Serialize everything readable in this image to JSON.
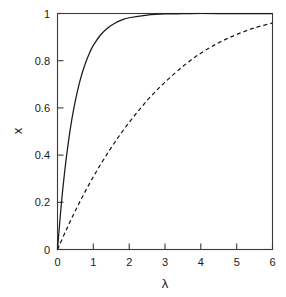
{
  "chart_data": {
    "type": "line",
    "title": "",
    "subtitle": "",
    "xlabel": "λ",
    "ylabel": "x",
    "xlim": [
      0,
      6
    ],
    "ylim": [
      0,
      1
    ],
    "grid": false,
    "legend": "none",
    "xticks": [
      0,
      1,
      2,
      3,
      4,
      5,
      6
    ],
    "xtick_labels": [
      "0",
      "1",
      "2",
      "3",
      "4",
      "5",
      "6"
    ],
    "yticks": [
      0,
      0.2,
      0.4,
      0.6,
      0.8,
      1
    ],
    "ytick_labels": [
      "0",
      "0.2",
      "0.4",
      "0.6",
      "0.8",
      "1"
    ],
    "series": [
      {
        "name": "solid-curve",
        "style": "solid",
        "color": "#1a1a1a",
        "x": [
          0,
          0.1,
          0.2,
          0.3,
          0.4,
          0.5,
          0.6,
          0.7,
          0.8,
          0.9,
          1.0,
          1.2,
          1.4,
          1.6,
          1.8,
          2.0,
          2.5,
          3.0,
          3.5,
          4.0,
          4.5,
          5.0,
          5.5,
          6.0
        ],
        "y": [
          0.0,
          0.181,
          0.33,
          0.451,
          0.551,
          0.632,
          0.699,
          0.753,
          0.798,
          0.835,
          0.865,
          0.909,
          0.939,
          0.959,
          0.973,
          0.982,
          0.993,
          0.998,
          0.999,
          1.0,
          1.0,
          1.0,
          1.0,
          1.0
        ]
      },
      {
        "name": "dashed-curve",
        "style": "dashed",
        "color": "#1a1a1a",
        "x": [
          0,
          0.25,
          0.5,
          0.75,
          1.0,
          1.25,
          1.5,
          1.75,
          2.0,
          2.25,
          2.5,
          2.75,
          3.0,
          3.5,
          4.0,
          4.5,
          5.0,
          5.5,
          6.0
        ],
        "y": [
          0.0,
          0.085,
          0.165,
          0.239,
          0.308,
          0.372,
          0.432,
          0.487,
          0.539,
          0.586,
          0.631,
          0.672,
          0.709,
          0.776,
          0.832,
          0.876,
          0.911,
          0.939,
          0.96
        ]
      }
    ],
    "annotations": []
  },
  "axes": {
    "y_axis_label": "x",
    "x_axis_label": "λ"
  }
}
